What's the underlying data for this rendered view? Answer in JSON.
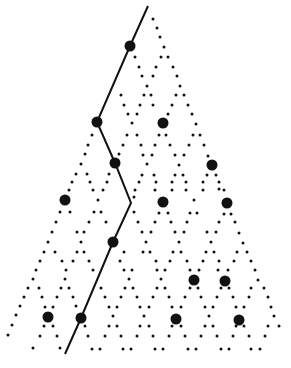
{
  "diagram": {
    "width": 291,
    "height": 368,
    "background": "#ffffff",
    "ink": "#111111",
    "small_dot_radius": 1.5,
    "large_dot_radius": 5.5,
    "line_width": 2,
    "path": [
      [
        148,
        6
      ],
      [
        130,
        46
      ],
      [
        97,
        122
      ],
      [
        115,
        163
      ],
      [
        131,
        203
      ],
      [
        113,
        242
      ],
      [
        81,
        318
      ],
      [
        65,
        354
      ]
    ],
    "large_dots": [
      [
        130,
        46
      ],
      [
        97,
        122
      ],
      [
        163,
        123
      ],
      [
        115,
        163
      ],
      [
        212,
        165
      ],
      [
        65,
        200
      ],
      [
        163,
        202
      ],
      [
        227,
        203
      ],
      [
        113,
        242
      ],
      [
        194,
        280
      ],
      [
        225,
        281
      ],
      [
        48,
        317
      ],
      [
        81,
        318
      ],
      [
        176,
        319
      ],
      [
        239,
        320
      ]
    ],
    "small_dots": [
      [
        153,
        19
      ],
      [
        157,
        28
      ],
      [
        160,
        37
      ],
      [
        164,
        47
      ],
      [
        135,
        57
      ],
      [
        161,
        57
      ],
      [
        168,
        57
      ],
      [
        139,
        67
      ],
      [
        156,
        67
      ],
      [
        173,
        67
      ],
      [
        142,
        76
      ],
      [
        153,
        76
      ],
      [
        177,
        76
      ],
      [
        147,
        86
      ],
      [
        180,
        86
      ],
      [
        121,
        95
      ],
      [
        144,
        95
      ],
      [
        151,
        95
      ],
      [
        176,
        95
      ],
      [
        184,
        95
      ],
      [
        124,
        105
      ],
      [
        140,
        105
      ],
      [
        153,
        105
      ],
      [
        172,
        105
      ],
      [
        188,
        105
      ],
      [
        128,
        114
      ],
      [
        137,
        114
      ],
      [
        168,
        114
      ],
      [
        192,
        114
      ],
      [
        132,
        123
      ],
      [
        196,
        124
      ],
      [
        92,
        135
      ],
      [
        127,
        135
      ],
      [
        137,
        135
      ],
      [
        159,
        135
      ],
      [
        166,
        135
      ],
      [
        193,
        135
      ],
      [
        200,
        135
      ],
      [
        88,
        145
      ],
      [
        123,
        145
      ],
      [
        141,
        145
      ],
      [
        155,
        145
      ],
      [
        170,
        145
      ],
      [
        189,
        145
      ],
      [
        204,
        145
      ],
      [
        85,
        154
      ],
      [
        119,
        154
      ],
      [
        143,
        155
      ],
      [
        152,
        155
      ],
      [
        175,
        155
      ],
      [
        184,
        155
      ],
      [
        208,
        156
      ],
      [
        81,
        164
      ],
      [
        147,
        164
      ],
      [
        179,
        165
      ],
      [
        76,
        174
      ],
      [
        87,
        174
      ],
      [
        109,
        174
      ],
      [
        142,
        175
      ],
      [
        154,
        175
      ],
      [
        175,
        175
      ],
      [
        183,
        175
      ],
      [
        207,
        175
      ],
      [
        216,
        175
      ],
      [
        72,
        182
      ],
      [
        90,
        182
      ],
      [
        107,
        182
      ],
      [
        139,
        182
      ],
      [
        156,
        182
      ],
      [
        172,
        182
      ],
      [
        186,
        182
      ],
      [
        203,
        182
      ],
      [
        219,
        182
      ],
      [
        69,
        190
      ],
      [
        93,
        190
      ],
      [
        103,
        190
      ],
      [
        135,
        190
      ],
      [
        155,
        190
      ],
      [
        172,
        190
      ],
      [
        186,
        190
      ],
      [
        203,
        190
      ],
      [
        219,
        189
      ],
      [
        98,
        200
      ],
      [
        134,
        197
      ],
      [
        194,
        200
      ],
      [
        224,
        190
      ],
      [
        60,
        212
      ],
      [
        70,
        212
      ],
      [
        94,
        212
      ],
      [
        101,
        212
      ],
      [
        134,
        212
      ],
      [
        159,
        213
      ],
      [
        168,
        213
      ],
      [
        190,
        213
      ],
      [
        197,
        213
      ],
      [
        224,
        214
      ],
      [
        231,
        214
      ],
      [
        56,
        222
      ],
      [
        89,
        222
      ],
      [
        106,
        222
      ],
      [
        138,
        222
      ],
      [
        155,
        222
      ],
      [
        171,
        222
      ],
      [
        187,
        222
      ],
      [
        219,
        222
      ],
      [
        235,
        222
      ],
      [
        52,
        232
      ],
      [
        77,
        232
      ],
      [
        84,
        232
      ],
      [
        142,
        232
      ],
      [
        151,
        232
      ],
      [
        175,
        232
      ],
      [
        184,
        232
      ],
      [
        207,
        232
      ],
      [
        216,
        232
      ],
      [
        239,
        233
      ],
      [
        48,
        242
      ],
      [
        81,
        242
      ],
      [
        146,
        242
      ],
      [
        179,
        242
      ],
      [
        211,
        242
      ],
      [
        243,
        243
      ],
      [
        44,
        252
      ],
      [
        55,
        252
      ],
      [
        77,
        252
      ],
      [
        84,
        252
      ],
      [
        124,
        252
      ],
      [
        143,
        252
      ],
      [
        150,
        252
      ],
      [
        173,
        252
      ],
      [
        181,
        252
      ],
      [
        206,
        252
      ],
      [
        214,
        252
      ],
      [
        237,
        252
      ],
      [
        247,
        252
      ],
      [
        40,
        261
      ],
      [
        62,
        261
      ],
      [
        73,
        261
      ],
      [
        89,
        261
      ],
      [
        120,
        261
      ],
      [
        156,
        261
      ],
      [
        170,
        261
      ],
      [
        187,
        261
      ],
      [
        203,
        261
      ],
      [
        219,
        261
      ],
      [
        234,
        261
      ],
      [
        251,
        261
      ],
      [
        36,
        270
      ],
      [
        66,
        270
      ],
      [
        93,
        270
      ],
      [
        124,
        270
      ],
      [
        132,
        270
      ],
      [
        157,
        270
      ],
      [
        165,
        270
      ],
      [
        190,
        270
      ],
      [
        199,
        270
      ],
      [
        218,
        270
      ],
      [
        228,
        270
      ],
      [
        255,
        270
      ],
      [
        33,
        279
      ],
      [
        65,
        279
      ],
      [
        129,
        279
      ],
      [
        161,
        279
      ],
      [
        258,
        280
      ],
      [
        28,
        288
      ],
      [
        39,
        288
      ],
      [
        61,
        288
      ],
      [
        69,
        288
      ],
      [
        101,
        288
      ],
      [
        125,
        288
      ],
      [
        133,
        288
      ],
      [
        157,
        288
      ],
      [
        165,
        288
      ],
      [
        190,
        288
      ],
      [
        198,
        288
      ],
      [
        221,
        288
      ],
      [
        229,
        288
      ],
      [
        251,
        288
      ],
      [
        264,
        288
      ],
      [
        24,
        297
      ],
      [
        42,
        297
      ],
      [
        57,
        297
      ],
      [
        73,
        297
      ],
      [
        105,
        297
      ],
      [
        121,
        297
      ],
      [
        137,
        297
      ],
      [
        153,
        297
      ],
      [
        169,
        297
      ],
      [
        185,
        297
      ],
      [
        201,
        297
      ],
      [
        217,
        297
      ],
      [
        233,
        297
      ],
      [
        249,
        297
      ],
      [
        268,
        297
      ],
      [
        20,
        306
      ],
      [
        45,
        307
      ],
      [
        53,
        307
      ],
      [
        76,
        306
      ],
      [
        109,
        307
      ],
      [
        117,
        307
      ],
      [
        140,
        307
      ],
      [
        149,
        307
      ],
      [
        172,
        307
      ],
      [
        181,
        307
      ],
      [
        205,
        307
      ],
      [
        213,
        307
      ],
      [
        236,
        307
      ],
      [
        244,
        307
      ],
      [
        271,
        307
      ],
      [
        16,
        315
      ],
      [
        113,
        316
      ],
      [
        144,
        316
      ],
      [
        209,
        316
      ],
      [
        274,
        316
      ],
      [
        12,
        325
      ],
      [
        44,
        326
      ],
      [
        53,
        326
      ],
      [
        85,
        326
      ],
      [
        109,
        326
      ],
      [
        117,
        326
      ],
      [
        140,
        326
      ],
      [
        149,
        326
      ],
      [
        172,
        326
      ],
      [
        181,
        326
      ],
      [
        205,
        326
      ],
      [
        213,
        326
      ],
      [
        236,
        326
      ],
      [
        244,
        326
      ],
      [
        268,
        326
      ],
      [
        279,
        326
      ],
      [
        8,
        335
      ],
      [
        40,
        336
      ],
      [
        57,
        336
      ],
      [
        88,
        336
      ],
      [
        105,
        336
      ],
      [
        121,
        336
      ],
      [
        137,
        336
      ],
      [
        153,
        336
      ],
      [
        169,
        336
      ],
      [
        185,
        336
      ],
      [
        201,
        336
      ],
      [
        217,
        336
      ],
      [
        233,
        336
      ],
      [
        249,
        336
      ],
      [
        265,
        336
      ],
      [
        33,
        348
      ],
      [
        60,
        348
      ],
      [
        92,
        349
      ],
      [
        100,
        349
      ],
      [
        123,
        349
      ],
      [
        131,
        349
      ],
      [
        155,
        349
      ],
      [
        163,
        349
      ],
      [
        188,
        349
      ],
      [
        196,
        349
      ],
      [
        221,
        349
      ],
      [
        229,
        349
      ],
      [
        251,
        349
      ],
      [
        260,
        349
      ]
    ]
  }
}
